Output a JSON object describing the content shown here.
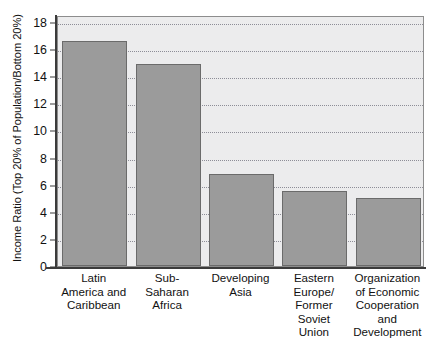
{
  "chart_data": {
    "type": "bar",
    "title": "",
    "xlabel": "",
    "ylabel": "Income Ratio (Top 20% of Population/Bottom 20%)",
    "categories": [
      "Latin America and Caribbean",
      "Sub-Saharan Africa",
      "Developing Asia",
      "Eastern Europe/ Former Soviet Union",
      "Organization of Economic Cooperation and Development"
    ],
    "category_lines": [
      [
        "Latin",
        "America and",
        "Caribbean"
      ],
      [
        "Sub-",
        "Saharan",
        "Africa"
      ],
      [
        "Developing",
        "Asia"
      ],
      [
        "Eastern",
        "Europe/",
        "Former",
        "Soviet",
        "Union"
      ],
      [
        "Organization",
        "of Economic",
        "Cooperation",
        "and",
        "Development"
      ]
    ],
    "values": [
      16.6,
      14.9,
      6.8,
      5.5,
      5.0
    ],
    "ylim": [
      0,
      18
    ],
    "ytick_values": [
      0,
      2,
      4,
      6,
      8,
      10,
      12,
      14,
      16,
      18
    ],
    "ytick_labels": [
      "0",
      "2",
      "4",
      "6",
      "8",
      "10",
      "12",
      "14",
      "16",
      "18"
    ],
    "grid": true,
    "legend": null,
    "bar_color": "#9b9b9b",
    "bar_edge_color": "#6b6b6b",
    "plot_background": "#ececed",
    "gridline_color": "#7d7d89",
    "axis_color": "#3b3b3b"
  }
}
